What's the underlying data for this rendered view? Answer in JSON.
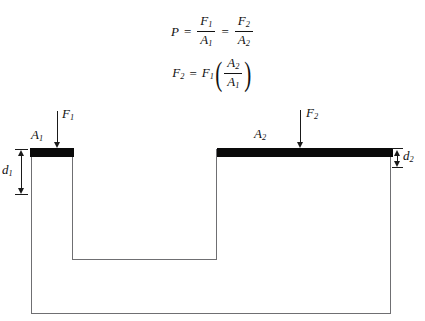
{
  "diagram": {
    "equations": {
      "eq1": {
        "lhs": "P",
        "eq_a": "=",
        "frac1_num": "F",
        "frac1_num_sub": "1",
        "frac1_den": "A",
        "frac1_den_sub": "1",
        "eq_b": "=",
        "frac2_num": "F",
        "frac2_num_sub": "2",
        "frac2_den": "A",
        "frac2_den_sub": "2"
      },
      "eq2": {
        "lhs": "F",
        "lhs_sub": "2",
        "eq_a": "=",
        "factor": "F",
        "factor_sub": "1",
        "paren_open": "(",
        "frac_num": "A",
        "frac_num_sub": "2",
        "frac_den": "A",
        "frac_den_sub": "1",
        "paren_close": ")"
      }
    },
    "labels": {
      "area_small": "A",
      "area_small_sub": "1",
      "area_large": "A",
      "area_large_sub": "2",
      "force_small": "F",
      "force_small_sub": "1",
      "force_large": "F",
      "force_large_sub": "2",
      "depth_small": "d",
      "depth_small_sub": "1",
      "depth_large": "d",
      "depth_large_sub": "2"
    },
    "colors": {
      "piston": "#0a0a0a",
      "vessel_outline": "#6f6f72",
      "text": "#111111",
      "arrow": "#1a1a1a",
      "background": "#ffffff"
    }
  }
}
